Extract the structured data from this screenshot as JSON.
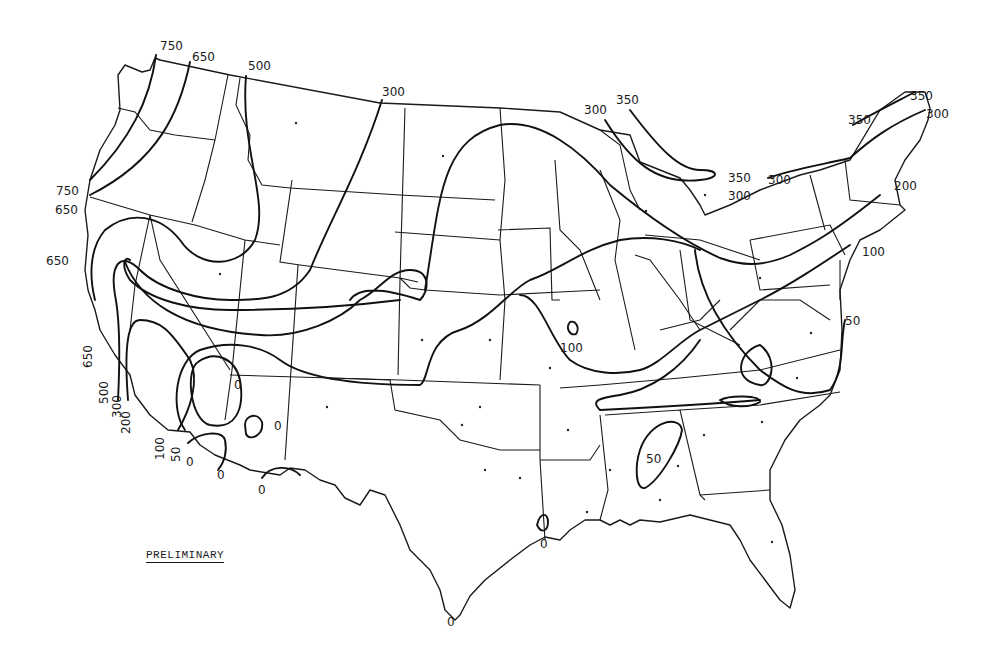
{
  "map": {
    "title": "Isopleth map of the contiguous United States",
    "stamp": "PRELIMINARY",
    "line_color": "#111111",
    "background": "#ffffff",
    "contour_values": [
      0,
      50,
      100,
      200,
      300,
      350,
      500,
      650,
      750
    ],
    "labels": [
      {
        "text": "750",
        "x": 160,
        "y": 50
      },
      {
        "text": "650",
        "x": 192,
        "y": 61
      },
      {
        "text": "500",
        "x": 248,
        "y": 70
      },
      {
        "text": "300",
        "x": 382,
        "y": 96
      },
      {
        "text": "750",
        "x": 56,
        "y": 195
      },
      {
        "text": "650",
        "x": 55,
        "y": 214
      },
      {
        "text": "650",
        "x": 46,
        "y": 265
      },
      {
        "text": "300",
        "x": 584,
        "y": 114
      },
      {
        "text": "350",
        "x": 616,
        "y": 104
      },
      {
        "text": "350",
        "x": 728,
        "y": 182
      },
      {
        "text": "300",
        "x": 728,
        "y": 200
      },
      {
        "text": "300",
        "x": 768,
        "y": 184
      },
      {
        "text": "350",
        "x": 848,
        "y": 124
      },
      {
        "text": "350",
        "x": 910,
        "y": 100
      },
      {
        "text": "300",
        "x": 926,
        "y": 118
      },
      {
        "text": "200",
        "x": 894,
        "y": 190
      },
      {
        "text": "100",
        "x": 862,
        "y": 256
      },
      {
        "text": "50",
        "x": 845,
        "y": 325
      },
      {
        "text": "100",
        "x": 560,
        "y": 352
      },
      {
        "text": "50",
        "x": 646,
        "y": 463
      },
      {
        "text": "0",
        "x": 234,
        "y": 389
      },
      {
        "text": "0",
        "x": 274,
        "y": 430
      },
      {
        "text": "0",
        "x": 217,
        "y": 479
      },
      {
        "text": "0",
        "x": 258,
        "y": 494
      },
      {
        "text": "0",
        "x": 540,
        "y": 548
      },
      {
        "text": "0",
        "x": 447,
        "y": 626
      }
    ],
    "rotated_labels": [
      {
        "text": "650",
        "x": 92,
        "y": 352
      },
      {
        "text": "500",
        "x": 108,
        "y": 402
      },
      {
        "text": "300",
        "x": 122,
        "y": 416
      },
      {
        "text": "200",
        "x": 130,
        "y": 424
      },
      {
        "text": "100",
        "x": 163,
        "y": 461
      },
      {
        "text": "50",
        "x": 180,
        "y": 461
      },
      {
        "text": "0",
        "x": 191,
        "y": 463
      }
    ]
  }
}
